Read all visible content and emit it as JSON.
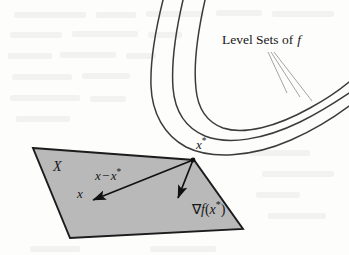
{
  "figure": {
    "kind": "optimality-condition-diagram",
    "width": 349,
    "height": 255,
    "background_color": "#fdfdfc"
  },
  "colors": {
    "ink": "#171717",
    "curve_stroke": "#3b3b3b",
    "leader_stroke": "#8d8d8d",
    "region_fill": "#b9b9b9",
    "region_stroke": "#1c1c1c",
    "arrow": "#111111"
  },
  "labels": {
    "level_sets": {
      "prefix": "Level Sets of",
      "function": "f",
      "full": "Level Sets of f"
    },
    "optimal_point": {
      "base": "x",
      "superscript": "*",
      "full": "x*"
    },
    "feasible_set": {
      "full": "X"
    },
    "difference_vector": {
      "lhs": "x",
      "operator": "−",
      "rhs_base": "x",
      "rhs_superscript": "*",
      "full": "x − x*"
    },
    "point_x": {
      "full": "x"
    },
    "gradient": {
      "nabla": "∇",
      "function": "f",
      "open_paren": "(",
      "arg_base": "x",
      "arg_superscript": "*",
      "close_paren": ")",
      "full": "∇f(x*)"
    }
  },
  "geometry": {
    "feasible_region_polygon": "33,148 194,160 243,229 70,238",
    "optimal_point": {
      "x": 193,
      "y": 160,
      "radius": 2.4
    },
    "arrow_difference": {
      "x1": 193,
      "y1": 160,
      "x2": 93,
      "y2": 200
    },
    "arrow_gradient": {
      "x1": 193,
      "y1": 160,
      "x2": 178,
      "y2": 198
    },
    "level_set_curves": [
      "M 163,0 C 156,28 150,58 151,86 C 152,113 164,135 186,147 C 210,159 250,158 291,140 C 318,128 337,115 349,106",
      "M 183,0 C 176,30 171,60 173,88 C 175,112 186,128 205,136 C 228,145 263,140 300,122 C 324,110 340,99 349,93",
      "M 205,0 C 198,31 193,62 196,89 C 198,110 207,122 223,128 C 244,135 276,127 310,108 C 330,97 343,87 349,82"
    ],
    "leader_lines": [
      {
        "x1": 268,
        "y1": 52,
        "x2": 287,
        "y2": 93
      },
      {
        "x1": 271,
        "y1": 52,
        "x2": 300,
        "y2": 97
      },
      {
        "x1": 274,
        "y1": 52,
        "x2": 312,
        "y2": 101
      }
    ]
  },
  "bleed_through_marks": [
    {
      "left": 14,
      "top": 12,
      "width": 72
    },
    {
      "left": 96,
      "top": 12,
      "width": 40
    },
    {
      "left": 146,
      "top": 11,
      "width": 58
    },
    {
      "left": 216,
      "top": 10,
      "width": 46
    },
    {
      "left": 272,
      "top": 11,
      "width": 62
    },
    {
      "left": 10,
      "top": 32,
      "width": 52
    },
    {
      "left": 72,
      "top": 31,
      "width": 66
    },
    {
      "left": 148,
      "top": 32,
      "width": 34
    },
    {
      "left": 8,
      "top": 53,
      "width": 44
    },
    {
      "left": 60,
      "top": 52,
      "width": 56
    },
    {
      "left": 126,
      "top": 53,
      "width": 30
    },
    {
      "left": 12,
      "top": 74,
      "width": 60
    },
    {
      "left": 82,
      "top": 73,
      "width": 48
    },
    {
      "left": 10,
      "top": 95,
      "width": 70
    },
    {
      "left": 90,
      "top": 96,
      "width": 36
    },
    {
      "left": 16,
      "top": 116,
      "width": 54
    },
    {
      "left": 250,
      "top": 150,
      "width": 60
    },
    {
      "left": 262,
      "top": 171,
      "width": 72
    },
    {
      "left": 256,
      "top": 192,
      "width": 44
    },
    {
      "left": 268,
      "top": 213,
      "width": 58
    },
    {
      "left": 30,
      "top": 246,
      "width": 50
    },
    {
      "left": 150,
      "top": 246,
      "width": 66
    }
  ]
}
